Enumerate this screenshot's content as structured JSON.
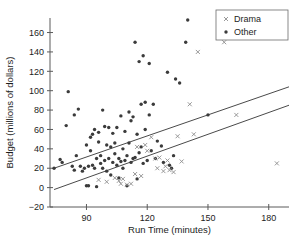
{
  "chart_data": {
    "type": "scatter",
    "title": "",
    "xlabel": "Run Time (minutes)",
    "ylabel": "Budget (millions of dollars)",
    "xlim": [
      72,
      190
    ],
    "ylim": [
      -20,
      175
    ],
    "xticks": [
      90,
      120,
      150,
      180
    ],
    "yticks": [
      -20,
      0,
      20,
      40,
      60,
      80,
      100,
      120,
      140,
      160
    ],
    "grid": false,
    "legend_position": "top-right",
    "legend": [
      {
        "name": "Drama",
        "marker": "x",
        "color": "#8d8d8d"
      },
      {
        "name": "Other",
        "marker": "dot",
        "color": "#3b3b3b"
      }
    ],
    "series": [
      {
        "name": "Other",
        "marker": "dot",
        "color": "#3b3b3b",
        "points": [
          [
            74,
            20
          ],
          [
            77,
            29
          ],
          [
            78,
            26
          ],
          [
            80,
            64
          ],
          [
            81,
            99
          ],
          [
            83,
            22
          ],
          [
            84,
            18
          ],
          [
            84,
            75
          ],
          [
            85,
            33
          ],
          [
            86,
            81
          ],
          [
            87,
            22
          ],
          [
            88,
            17
          ],
          [
            89,
            20
          ],
          [
            90,
            44
          ],
          [
            90,
            2
          ],
          [
            91,
            2
          ],
          [
            91,
            22
          ],
          [
            92,
            38
          ],
          [
            92,
            52
          ],
          [
            93,
            55
          ],
          [
            93,
            23
          ],
          [
            94,
            20
          ],
          [
            94,
            60
          ],
          [
            95,
            1
          ],
          [
            95,
            30
          ],
          [
            96,
            47
          ],
          [
            96,
            57
          ],
          [
            97,
            25
          ],
          [
            97,
            33
          ],
          [
            98,
            80
          ],
          [
            98,
            20
          ],
          [
            99,
            63
          ],
          [
            99,
            28
          ],
          [
            100,
            44
          ],
          [
            100,
            17
          ],
          [
            101,
            62
          ],
          [
            101,
            30
          ],
          [
            102,
            13
          ],
          [
            102,
            42
          ],
          [
            103,
            56
          ],
          [
            103,
            26
          ],
          [
            104,
            35
          ],
          [
            104,
            46
          ],
          [
            105,
            23
          ],
          [
            105,
            62
          ],
          [
            106,
            30
          ],
          [
            106,
            10
          ],
          [
            107,
            27
          ],
          [
            107,
            74
          ],
          [
            108,
            20
          ],
          [
            108,
            40
          ],
          [
            109,
            28
          ],
          [
            109,
            58
          ],
          [
            110,
            33
          ],
          [
            110,
            2
          ],
          [
            111,
            46
          ],
          [
            111,
            78
          ],
          [
            112,
            26
          ],
          [
            112,
            69
          ],
          [
            113,
            30
          ],
          [
            113,
            73
          ],
          [
            114,
            150
          ],
          [
            114,
            31
          ],
          [
            115,
            9
          ],
          [
            115,
            55
          ],
          [
            116,
            130
          ],
          [
            116,
            36
          ],
          [
            117,
            86
          ],
          [
            117,
            42
          ],
          [
            118,
            136
          ],
          [
            118,
            25
          ],
          [
            119,
            60
          ],
          [
            119,
            88
          ],
          [
            120,
            28
          ],
          [
            121,
            128
          ],
          [
            121,
            75
          ],
          [
            122,
            38
          ],
          [
            123,
            86
          ],
          [
            124,
            30
          ],
          [
            125,
            48
          ],
          [
            127,
            43
          ],
          [
            128,
            26
          ],
          [
            130,
            119
          ],
          [
            131,
            23
          ],
          [
            132,
            20
          ],
          [
            133,
            33
          ],
          [
            134,
            112
          ],
          [
            136,
            108
          ],
          [
            139,
            150
          ],
          [
            140,
            173
          ],
          [
            150,
            75
          ]
        ]
      },
      {
        "name": "Drama",
        "marker": "x",
        "color": "#8d8d8d",
        "points": [
          [
            96,
            8
          ],
          [
            100,
            6
          ],
          [
            104,
            10
          ],
          [
            106,
            7
          ],
          [
            107,
            4
          ],
          [
            108,
            9
          ],
          [
            110,
            3
          ],
          [
            112,
            4
          ],
          [
            114,
            14
          ],
          [
            115,
            42
          ],
          [
            117,
            12
          ],
          [
            119,
            44
          ],
          [
            120,
            38
          ],
          [
            122,
            52
          ],
          [
            124,
            30
          ],
          [
            125,
            20
          ],
          [
            126,
            31
          ],
          [
            128,
            17
          ],
          [
            129,
            22
          ],
          [
            130,
            28
          ],
          [
            131,
            18
          ],
          [
            133,
            16
          ],
          [
            135,
            53
          ],
          [
            137,
            27
          ],
          [
            141,
            86
          ],
          [
            143,
            55
          ],
          [
            145,
            140
          ],
          [
            158,
            150
          ],
          [
            164,
            75
          ],
          [
            184,
            25
          ]
        ]
      }
    ],
    "trend_lines": [
      {
        "name": "upper-fit",
        "x1": 74,
        "y1": 20,
        "x2": 190,
        "y2": 104
      },
      {
        "name": "lower-fit",
        "x1": 74,
        "y1": -2,
        "x2": 190,
        "y2": 85
      }
    ]
  }
}
